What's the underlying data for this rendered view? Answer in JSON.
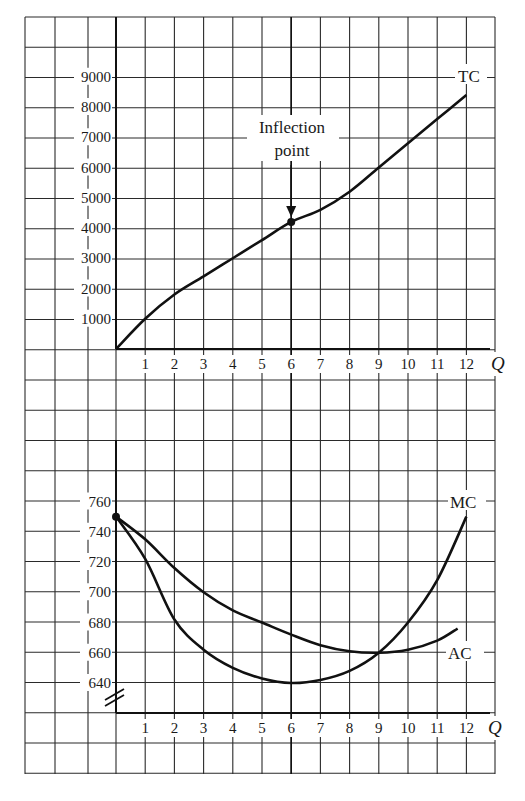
{
  "chart_data": [
    {
      "type": "line",
      "title": "",
      "xlabel": "Q",
      "ylabel": "",
      "x": [
        0,
        1,
        2,
        3,
        4,
        5,
        6,
        7,
        8,
        9,
        10,
        11,
        12
      ],
      "x_tick_labels": [
        "1",
        "2",
        "3",
        "4",
        "5",
        "6",
        "7",
        "8",
        "9",
        "10",
        "11",
        "12"
      ],
      "y_tick_labels": [
        "1000",
        "2000",
        "3000",
        "4000",
        "5000",
        "6000",
        "7000",
        "8000",
        "9000"
      ],
      "ylim": [
        0,
        10000
      ],
      "xlim": [
        0,
        13
      ],
      "grid": true,
      "series": [
        {
          "name": "TC",
          "values": [
            0,
            1000,
            1800,
            2400,
            3000,
            3600,
            4200,
            4600,
            5200,
            6000,
            6800,
            7600,
            8400
          ]
        }
      ],
      "annotations": [
        {
          "text": "Inflection point",
          "x": 6,
          "y": 4200,
          "arrow": true
        }
      ]
    },
    {
      "type": "line",
      "title": "",
      "xlabel": "Q",
      "ylabel": "",
      "x": [
        0,
        1,
        2,
        3,
        4,
        5,
        6,
        7,
        8,
        9,
        10,
        11,
        12
      ],
      "x_tick_labels": [
        "1",
        "2",
        "3",
        "4",
        "5",
        "6",
        "7",
        "8",
        "9",
        "10",
        "11",
        "12"
      ],
      "y_tick_labels": [
        "640",
        "660",
        "680",
        "700",
        "720",
        "740",
        "760"
      ],
      "ylim": [
        620,
        780
      ],
      "xlim": [
        0,
        13
      ],
      "grid": true,
      "axis_break": true,
      "series": [
        {
          "name": "MC",
          "values": [
            750,
            722,
            682,
            662,
            650,
            643,
            640,
            642,
            648,
            660,
            680,
            708,
            750
          ]
        },
        {
          "name": "AC",
          "values": [
            750,
            735,
            716,
            700,
            688,
            680,
            672,
            665,
            661,
            660,
            662,
            668,
            676
          ]
        }
      ],
      "ac_last_x": 11.7
    }
  ],
  "labels": {
    "tc": "TC",
    "mc": "MC",
    "ac": "AC",
    "q_top": "Q",
    "q_bottom": "Q",
    "inflection_line1": "Inflection",
    "inflection_line2": "point"
  }
}
